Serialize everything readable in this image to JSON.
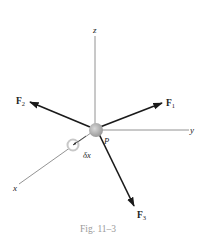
{
  "figure": {
    "caption": "Fig. 11–3",
    "point_label": "P",
    "displacement_label": "δx"
  },
  "axes": {
    "x": "x",
    "y": "y",
    "z": "z"
  },
  "forces": [
    {
      "name": "F",
      "sub": "1"
    },
    {
      "name": "F",
      "sub": "2"
    },
    {
      "name": "F",
      "sub": "3"
    }
  ],
  "colors": {
    "axis": "#777777",
    "force": "#1a1a1a",
    "particle": "#a8a8a8",
    "caption": "#9a9a9a"
  }
}
